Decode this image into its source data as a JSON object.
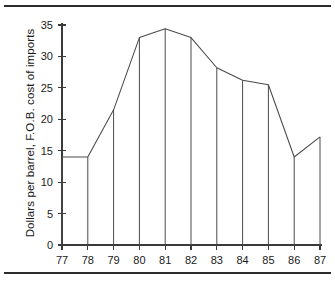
{
  "figure": {
    "rule_top": "horizontal-rule",
    "rule_bottom": "horizontal-rule"
  },
  "chart_data": {
    "type": "line",
    "title": "",
    "subtitle": "",
    "xlabel": "",
    "ylabel": "Dollars per barrel, F.O.B. cost of imports",
    "categories": [
      "77",
      "78",
      "79",
      "80",
      "81",
      "82",
      "83",
      "84",
      "85",
      "86",
      "87"
    ],
    "x": [
      77,
      78,
      79,
      80,
      81,
      82,
      83,
      84,
      85,
      86,
      87
    ],
    "values": [
      14.0,
      14.0,
      21.5,
      33.0,
      34.4,
      33.0,
      28.2,
      26.2,
      25.5,
      14.0,
      17.2
    ],
    "series": [
      {
        "name": "F.O.B. cost of imports",
        "values": [
          14.0,
          14.0,
          21.5,
          33.0,
          34.4,
          33.0,
          28.2,
          26.2,
          25.5,
          14.0,
          17.2
        ]
      }
    ],
    "ylim": [
      0,
      35
    ],
    "xlim": [
      77,
      87
    ],
    "yticks": [
      0,
      5,
      10,
      15,
      20,
      25,
      30,
      35
    ],
    "ytick_labels": [
      "0",
      "5",
      "10",
      "15",
      "20",
      "25",
      "30",
      "35"
    ],
    "xtick_labels": [
      "77",
      "78",
      "79",
      "80",
      "81",
      "82",
      "83",
      "84",
      "85",
      "86",
      "87"
    ],
    "grid": false,
    "legend": false,
    "legend_position": "none",
    "drop_lines": true,
    "line_color": "#4a4a4a",
    "axis_color": "#3a3a3a",
    "background": "#ffffff"
  }
}
